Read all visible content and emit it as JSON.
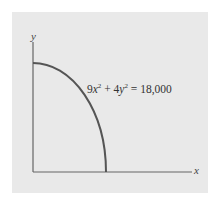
{
  "diagram": {
    "type": "graph",
    "axes": {
      "x_label": "x",
      "y_label": "y"
    },
    "equation": {
      "coef_x": "9",
      "var_x": "x",
      "exp_x": "2",
      "plus": " + ",
      "coef_y": "4",
      "var_y": "y",
      "exp_y": "2",
      "rhs": " = 18,000"
    },
    "curve": "quarter ellipse in first quadrant",
    "colors": {
      "panel": "#e9e9e9",
      "axis": "#555555",
      "curve": "#555555"
    }
  }
}
